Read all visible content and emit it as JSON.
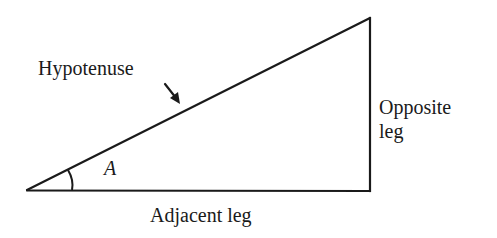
{
  "diagram": {
    "labels": {
      "hypotenuse": "Hypotenuse",
      "angle": "A",
      "opposite_line1": "Opposite",
      "opposite_line2": "leg",
      "adjacent": "Adjacent leg"
    },
    "geometry": {
      "vertex_angle_A": [
        27,
        190
      ],
      "vertex_top_right": [
        370,
        18
      ],
      "vertex_right_angle": [
        370,
        191
      ]
    },
    "colors": {
      "stroke": "#1a1a1a",
      "text": "#1a1a1a",
      "background": "#ffffff"
    }
  }
}
